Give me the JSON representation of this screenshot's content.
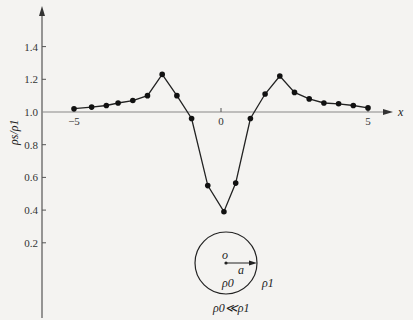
{
  "chart_data": {
    "type": "line",
    "title": "",
    "xlabel": "x",
    "ylabel": "ρs/ρ1",
    "xlim": [
      -5.2,
      5.6
    ],
    "ylim": [
      0.15,
      1.6
    ],
    "grid": false,
    "legend": null,
    "x_ticks": [
      "-5",
      "0",
      "5"
    ],
    "y_ticks": [
      "0.2",
      "0.4",
      "0.6",
      "0.8",
      "1.0",
      "1.2",
      "1.4"
    ],
    "series": [
      {
        "name": "ρs/ρ1",
        "x": [
          -5,
          -4.4,
          -3.9,
          -3.5,
          -3,
          -2.5,
          -2,
          -1.5,
          -1,
          -0.45,
          0.1,
          0.5,
          1,
          1.5,
          2,
          2.5,
          3,
          3.5,
          4,
          4.5,
          5
        ],
        "values": [
          1.02,
          1.03,
          1.04,
          1.055,
          1.07,
          1.1,
          1.23,
          1.1,
          0.96,
          0.55,
          0.39,
          0.565,
          0.96,
          1.11,
          1.22,
          1.12,
          1.08,
          1.055,
          1.05,
          1.04,
          1.025
        ]
      }
    ],
    "annotations": {
      "inset": "circle of radius a centered at o",
      "center_label": "o",
      "radius_label": "a",
      "inside_label": "ρ0",
      "outside_label": "ρ1",
      "condition": "ρ0≪ρ1"
    }
  }
}
